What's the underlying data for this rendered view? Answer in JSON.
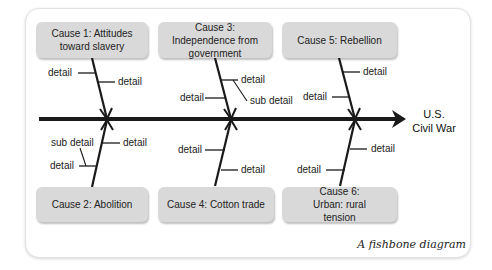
{
  "diagram": {
    "type": "fishbone",
    "effect": {
      "line1": "U.S.",
      "line2": "Civil War"
    },
    "caption": "A fishbone diagram",
    "causes": [
      {
        "id": 1,
        "label": "Cause 1: Attitudes toward slavery",
        "position": "top"
      },
      {
        "id": 2,
        "label": "Cause 2: Abolition",
        "position": "bottom"
      },
      {
        "id": 3,
        "label": "Cause 3: Independence from government",
        "position": "top"
      },
      {
        "id": 4,
        "label": "Cause 4: Cotton trade",
        "position": "bottom"
      },
      {
        "id": 5,
        "label": "Cause 5: Rebellion",
        "position": "top"
      },
      {
        "id": 6,
        "label": "Cause 6: Urban: rural tension",
        "position": "bottom"
      }
    ],
    "labels": {
      "detail": "detail",
      "sub_detail": "sub detail"
    }
  }
}
